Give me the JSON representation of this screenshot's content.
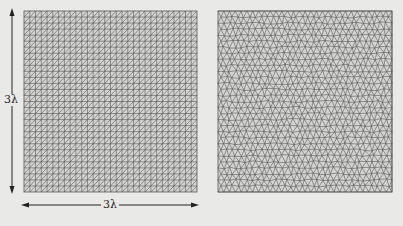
{
  "figure": {
    "background": "#e9e9e7",
    "line_color": "#555555",
    "mesh_fill": "#d4d4d2",
    "left_panel": {
      "name": "structured-mesh",
      "description": "Structured right-triangle mesh",
      "x": 24,
      "y": 11,
      "width": 173,
      "height": 181,
      "divisions": 30,
      "diagonal": "lower-left to upper-right"
    },
    "right_panel": {
      "name": "unstructured-mesh",
      "description": "Unstructured near-equilateral triangle mesh",
      "x": 218,
      "y": 11,
      "width": 174,
      "height": 181,
      "divisions": 30
    },
    "dimensions": {
      "vertical_label": "3λ",
      "horizontal_label": "3λ"
    }
  }
}
